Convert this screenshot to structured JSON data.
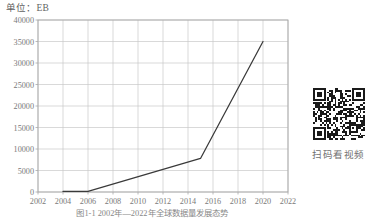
{
  "unit_label": "单位：EB",
  "figure_caption": "图1-1  2002年—2022年全球数据量发展态势",
  "qr": {
    "caption": "扫码看视频",
    "icon": "qr-code-icon"
  },
  "colors": {
    "line": "#3a3a3a",
    "grid": "#c8c8c8",
    "axis": "#a8a8a8",
    "tick_text": "#7a7a7a",
    "background": "#ffffff"
  },
  "chart_data": {
    "type": "line",
    "title": "",
    "subtitle": "",
    "xlabel": "",
    "ylabel": "",
    "unit": "EB",
    "xlim": [
      2002,
      2022
    ],
    "ylim": [
      0,
      40000
    ],
    "xticks": [
      2002,
      2004,
      2006,
      2008,
      2010,
      2012,
      2014,
      2016,
      2018,
      2020,
      2022
    ],
    "yticks": [
      0,
      5000,
      10000,
      15000,
      20000,
      25000,
      30000,
      35000,
      40000
    ],
    "xtick_labels": [
      "2002",
      "2004",
      "2006",
      "2008",
      "2010",
      "2012",
      "2014",
      "2016",
      "2018",
      "2020",
      "2022"
    ],
    "ytick_labels": [
      "0",
      "5000",
      "10000",
      "15000",
      "20000",
      "25000",
      "30000",
      "35000",
      "40000"
    ],
    "grid": true,
    "legend": false,
    "series": [
      {
        "name": "全球数据量",
        "x": [
          2004,
          2006,
          2015,
          2020
        ],
        "values": [
          120,
          160,
          7800,
          35000
        ]
      }
    ]
  }
}
